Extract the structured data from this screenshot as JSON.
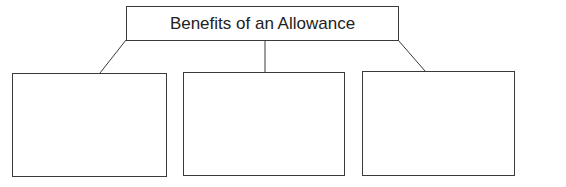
{
  "diagram": {
    "title": "Benefits of an Allowance",
    "children": [
      {
        "label": ""
      },
      {
        "label": ""
      },
      {
        "label": ""
      }
    ],
    "colors": {
      "stroke": "#3a3a3a",
      "background": "#ffffff"
    }
  }
}
